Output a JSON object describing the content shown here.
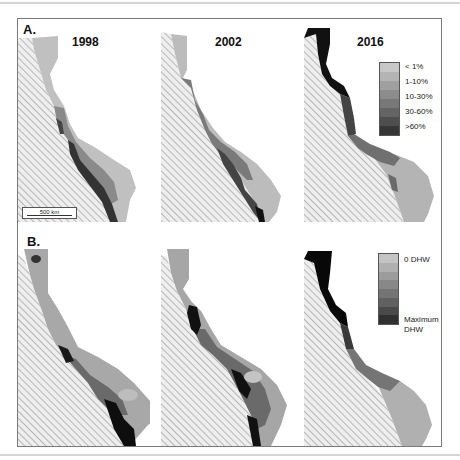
{
  "figure": {
    "panels": [
      {
        "label": "A.",
        "title_row": "Bleaching severity"
      },
      {
        "label": "B.",
        "title_row": "Heat stress"
      }
    ],
    "years": [
      "1998",
      "2002",
      "2016"
    ],
    "legend_a": {
      "items": [
        "< 1%",
        "1-10%",
        "10-30%",
        "30-60%",
        ">60%"
      ],
      "colors": [
        "#c8c8c8",
        "#b4b4b4",
        "#a0a0a0",
        "#8c8c8c",
        "#787878",
        "#646464",
        "#4e4e4e",
        "#363636"
      ]
    },
    "legend_b": {
      "top_label": "0 DHW",
      "bottom_label": "Maximum DHW",
      "bottom_label_line1": "Maximum",
      "bottom_label_line2": "DHW",
      "colors": [
        "#c4c4c4",
        "#b0b0b0",
        "#9c9c9c",
        "#888888",
        "#747474",
        "#606060",
        "#4a4a4a",
        "#303030"
      ]
    },
    "scale_bar": "500 km",
    "colors": {
      "land_hatch": "#9a9a9a",
      "land_bg": "#efefef",
      "reef_light": "#b8b8b8",
      "reef_dark": "#111111",
      "frame": "#7a7a7a"
    }
  }
}
